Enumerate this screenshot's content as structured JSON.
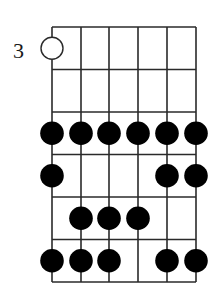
{
  "diagram": {
    "type": "guitar-scale-fretboard",
    "start_fret_label": "3",
    "strings": 6,
    "frets_shown": 6,
    "colors": {
      "line": "#2a2a2a",
      "dot": "#000000",
      "open_dot_fill": "#ffffff",
      "background": "#ffffff"
    },
    "notes": [
      {
        "fret": 1,
        "string": 1,
        "style": "open"
      },
      {
        "fret": 3,
        "string": 1,
        "style": "filled"
      },
      {
        "fret": 3,
        "string": 2,
        "style": "filled"
      },
      {
        "fret": 3,
        "string": 3,
        "style": "filled"
      },
      {
        "fret": 3,
        "string": 4,
        "style": "filled"
      },
      {
        "fret": 3,
        "string": 5,
        "style": "filled"
      },
      {
        "fret": 3,
        "string": 6,
        "style": "filled"
      },
      {
        "fret": 4,
        "string": 1,
        "style": "filled"
      },
      {
        "fret": 4,
        "string": 5,
        "style": "filled"
      },
      {
        "fret": 4,
        "string": 6,
        "style": "filled"
      },
      {
        "fret": 5,
        "string": 2,
        "style": "filled"
      },
      {
        "fret": 5,
        "string": 3,
        "style": "filled"
      },
      {
        "fret": 5,
        "string": 4,
        "style": "filled"
      },
      {
        "fret": 6,
        "string": 1,
        "style": "filled"
      },
      {
        "fret": 6,
        "string": 2,
        "style": "filled"
      },
      {
        "fret": 6,
        "string": 3,
        "style": "filled"
      },
      {
        "fret": 6,
        "string": 5,
        "style": "filled"
      },
      {
        "fret": 6,
        "string": 6,
        "style": "filled"
      }
    ]
  }
}
